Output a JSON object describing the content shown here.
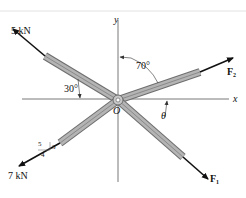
{
  "figure": {
    "axes": {
      "x_label": "x",
      "y_label": "y",
      "origin_label": "O"
    },
    "forces": [
      {
        "id": "force-5kn",
        "label": "5 kN",
        "direction": "upper-left"
      },
      {
        "id": "force-f2",
        "label": "F",
        "subscript": "2",
        "direction": "upper-right"
      },
      {
        "id": "force-7kn",
        "label": "7 kN",
        "direction": "lower-left",
        "slope": {
          "hyp": "5",
          "rise": "3",
          "run": "4"
        }
      },
      {
        "id": "force-f1",
        "label": "F",
        "subscript": "1",
        "direction": "lower-right"
      }
    ],
    "angles": [
      {
        "id": "angle-30",
        "label": "30°"
      },
      {
        "id": "angle-70",
        "label": "70°"
      },
      {
        "id": "angle-theta",
        "label": "θ"
      }
    ],
    "colors": {
      "member_fill": "#a9a9a9",
      "member_edge": "#6e6e6e",
      "axis": "#555555",
      "arrow": "#111111"
    }
  }
}
